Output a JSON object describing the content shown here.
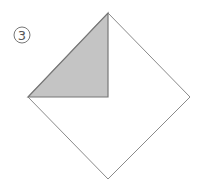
{
  "diagram": {
    "step_number": "3",
    "colors": {
      "outline": "#8a8a8a",
      "shaded_fill": "#c4c4c4",
      "shaded_stroke": "#777777",
      "label": "#555555"
    },
    "shapes": {
      "diamond": {
        "top": [
          108,
          13
        ],
        "right": [
          190,
          97
        ],
        "bottom": [
          108,
          179
        ],
        "left": [
          28,
          97
        ]
      },
      "shaded_triangle": {
        "points": [
          [
            108,
            13
          ],
          [
            108,
            97
          ],
          [
            28,
            97
          ]
        ]
      }
    },
    "label_position": {
      "cx": 22,
      "cy": 35,
      "r": 8
    }
  }
}
